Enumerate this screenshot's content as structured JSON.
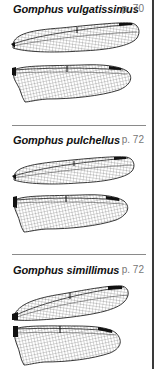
{
  "entries": [
    {
      "species": "Gomphus vulgatissimus",
      "page": "p. 70",
      "figure": "forewing-and-hindwing-venation"
    },
    {
      "species": "Gomphus pulchellus",
      "page": "p. 72",
      "figure": "forewing-and-hindwing-venation"
    },
    {
      "species": "Gomphus simillimus",
      "page": "p. 72",
      "figure": "forewing-and-hindwing-venation"
    }
  ],
  "colors": {
    "ink": "#111111",
    "page_number": "#777777",
    "divider": "#8a8a8a",
    "pterostigma": "#111111"
  }
}
